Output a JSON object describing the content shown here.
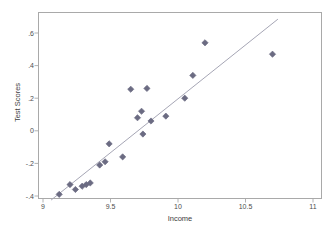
{
  "chart_data": {
    "type": "scatter",
    "title": "",
    "xlabel": "Income",
    "ylabel": "Test Scores",
    "xlim": [
      9,
      11
    ],
    "ylim": [
      -0.47,
      0.69
    ],
    "grid": false,
    "legend": null,
    "xticks": [
      {
        "value": 9,
        "label": "9"
      },
      {
        "value": 9.5,
        "label": "9.5"
      },
      {
        "value": 10,
        "label": "10"
      },
      {
        "value": 10.5,
        "label": "10.5"
      },
      {
        "value": 11,
        "label": "11"
      }
    ],
    "yticks": [
      {
        "value": 0.6,
        "label": ".6"
      },
      {
        "value": 0.4,
        "label": ".4"
      },
      {
        "value": 0.2,
        "label": ".2"
      },
      {
        "value": 0.0,
        "label": "0"
      },
      {
        "value": -0.2,
        "label": "-.2"
      },
      {
        "value": -0.4,
        "label": "-.4"
      }
    ],
    "marker": {
      "shape": "diamond",
      "color": "#6b6b82",
      "size": 5
    },
    "series": [
      {
        "name": "Test Scores",
        "points": [
          {
            "x": 9.12,
            "y": -0.39
          },
          {
            "x": 9.2,
            "y": -0.33
          },
          {
            "x": 9.24,
            "y": -0.36
          },
          {
            "x": 9.29,
            "y": -0.34
          },
          {
            "x": 9.32,
            "y": -0.33
          },
          {
            "x": 9.35,
            "y": -0.32
          },
          {
            "x": 9.42,
            "y": -0.21
          },
          {
            "x": 9.46,
            "y": -0.19
          },
          {
            "x": 9.49,
            "y": -0.08
          },
          {
            "x": 9.59,
            "y": -0.16
          },
          {
            "x": 9.65,
            "y": 0.255
          },
          {
            "x": 9.7,
            "y": 0.08
          },
          {
            "x": 9.73,
            "y": 0.12
          },
          {
            "x": 9.74,
            "y": -0.02
          },
          {
            "x": 9.77,
            "y": 0.26
          },
          {
            "x": 9.8,
            "y": 0.06
          },
          {
            "x": 9.91,
            "y": 0.09
          },
          {
            "x": 10.05,
            "y": 0.2
          },
          {
            "x": 10.11,
            "y": 0.34
          },
          {
            "x": 10.2,
            "y": 0.54
          },
          {
            "x": 10.7,
            "y": 0.47
          }
        ]
      }
    ],
    "fit_line": {
      "name": "linear fit",
      "color": "#a6a6b5",
      "x_start": 9.06,
      "y_start": -0.425,
      "x_end": 10.74,
      "y_end": 0.685
    }
  }
}
